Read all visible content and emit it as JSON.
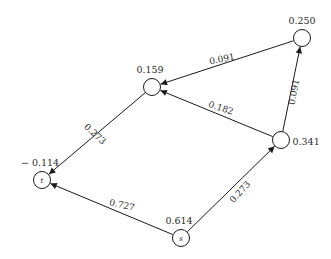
{
  "figure": {
    "title": "",
    "background_color": "#ffffff",
    "stroke_color": "#1a1a1a",
    "text_color": "#2b2b2b"
  },
  "chart_data": {
    "type": "diagram",
    "subtype": "directed-network-graph",
    "title": "",
    "xlabel": "",
    "ylabel": "",
    "grid": false,
    "legend": "none",
    "nodes": [
      {
        "id": "n1",
        "inner_label": "",
        "value": "0.250",
        "value_number": 0.25,
        "x": 302,
        "y": 38,
        "r": 8.5,
        "value_pos": "above"
      },
      {
        "id": "n2",
        "inner_label": "",
        "value": "0.159",
        "value_number": 0.159,
        "x": 152,
        "y": 87,
        "r": 8.5,
        "value_pos": "above-left"
      },
      {
        "id": "n3",
        "inner_label": "",
        "value": "0.341",
        "value_number": 0.341,
        "x": 281,
        "y": 140,
        "r": 8.5,
        "value_pos": "right"
      },
      {
        "id": "n4",
        "inner_label": "t",
        "value": "− 0.114",
        "value_number": -0.114,
        "x": 42,
        "y": 180,
        "r": 8.5,
        "value_pos": "above-left"
      },
      {
        "id": "n5",
        "inner_label": "s",
        "value": "0.614",
        "value_number": 0.614,
        "x": 181,
        "y": 238,
        "r": 8.5,
        "value_pos": "above-left"
      }
    ],
    "edges": [
      {
        "id": "e1",
        "from": "n1",
        "to": "n2",
        "weight": "0.091",
        "weight_number": 0.091,
        "label_x": 222,
        "label_y": 59,
        "label_rotation": -11
      },
      {
        "id": "e2",
        "from": "n3",
        "to": "n1",
        "weight": "0.091",
        "weight_number": 0.091,
        "label_x": 294,
        "label_y": 92,
        "label_rotation": -79
      },
      {
        "id": "e3",
        "from": "n3",
        "to": "n2",
        "weight": "0.182",
        "weight_number": 0.182,
        "label_x": 221,
        "label_y": 108,
        "label_rotation": 18
      },
      {
        "id": "e4",
        "from": "n2",
        "to": "n4",
        "weight": "0.273",
        "weight_number": 0.273,
        "label_x": 95,
        "label_y": 134,
        "label_rotation": 43
      },
      {
        "id": "e5",
        "from": "n5",
        "to": "n3",
        "weight": "0.273",
        "weight_number": 0.273,
        "label_x": 240,
        "label_y": 192,
        "label_rotation": -47
      },
      {
        "id": "e6",
        "from": "n5",
        "to": "n4",
        "weight": "0.727",
        "weight_number": 0.727,
        "label_x": 122,
        "label_y": 205,
        "label_rotation": 13
      }
    ]
  }
}
